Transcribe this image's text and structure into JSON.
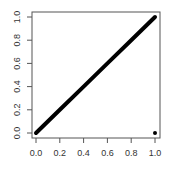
{
  "chart_data": {
    "type": "line",
    "title": "",
    "xlabel": "",
    "ylabel": "",
    "xlim": [
      0.0,
      1.0
    ],
    "ylim": [
      0.0,
      1.0
    ],
    "grid": false,
    "legend": null,
    "x_ticks": [
      "0.0",
      "0.2",
      "0.4",
      "0.6",
      "0.8",
      "1.0"
    ],
    "y_ticks": [
      "0.0",
      "0.2",
      "0.4",
      "0.6",
      "0.8",
      "1.0"
    ],
    "series": [
      {
        "name": "diagonal",
        "style": "thick-line",
        "color": "#000000",
        "x": [
          0.0,
          0.2,
          0.4,
          0.6,
          0.8,
          1.0
        ],
        "y": [
          0.0,
          0.2,
          0.4,
          0.6,
          0.8,
          1.0
        ]
      },
      {
        "name": "point",
        "style": "point",
        "color": "#000000",
        "x": [
          1.0
        ],
        "y": [
          0.0
        ]
      }
    ]
  }
}
